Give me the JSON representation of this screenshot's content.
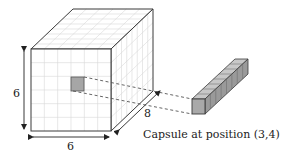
{
  "diagram": {
    "cube": {
      "width_label": "6",
      "height_label": "6",
      "depth_label": "8",
      "grid_rows": 6,
      "grid_cols": 6,
      "grid_depth": 8
    },
    "highlight_cell": {
      "col": 3,
      "row": 4
    },
    "capsule": {
      "caption": "Capsule at position (3,4)",
      "segments": 8
    },
    "colors": {
      "edge": "#3a3a3a",
      "grid": "#d8d8d8",
      "highlight": "#a6a6a6",
      "capsule_front": "#a9a9a9",
      "capsule_top": "#c8c8c8",
      "capsule_side": "#9a9a9a",
      "dashed": "#555555",
      "background": "#ffffff"
    }
  }
}
